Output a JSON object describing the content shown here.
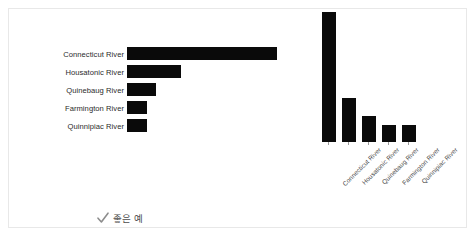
{
  "figure": {
    "frame_color": "#e8e8e8",
    "bar_color": "#0a0a0a",
    "background": "#ffffff"
  },
  "left_panel": {
    "caption": {
      "icon": "check-icon",
      "text": "좋은 예",
      "color": "#4b4b4b"
    }
  },
  "right_panel": {
    "caption": {
      "icon": "circle-outline-icon",
      "text": "개선이 필요한 차트",
      "color": "#4b4b4b"
    }
  },
  "chart_data": [
    {
      "type": "bar",
      "orientation": "horizontal",
      "title": "",
      "xlabel": "",
      "ylabel": "",
      "grid": false,
      "legend": "none",
      "categories": [
        "Connecticut River",
        "Housatonic River",
        "Quinebaug River",
        "Farmington River",
        "Quinnipiac River"
      ],
      "values": [
        100,
        36,
        19,
        13,
        13
      ],
      "xlim": [
        0,
        100
      ]
    },
    {
      "type": "bar",
      "orientation": "vertical",
      "title": "",
      "xlabel": "",
      "ylabel": "",
      "grid": false,
      "legend": "none",
      "tick_label_rotation": -45,
      "categories": [
        "Connecticut River",
        "Housatonic River",
        "Quinebaug River",
        "Farmington River",
        "Quinnipiac River"
      ],
      "values": [
        100,
        34,
        20,
        13,
        13
      ],
      "ylim": [
        0,
        100
      ]
    }
  ]
}
